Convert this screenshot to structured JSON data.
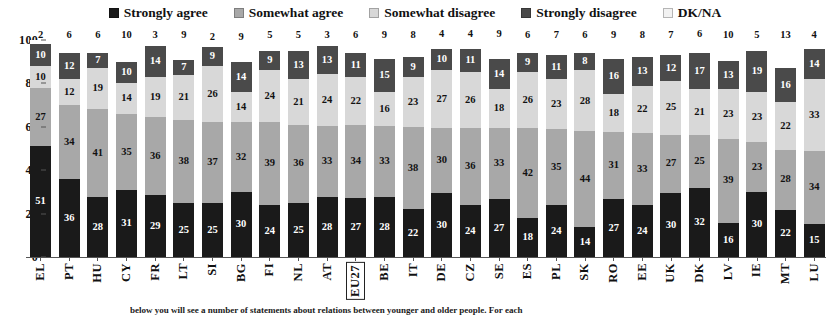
{
  "legend": {
    "position": "top-center",
    "items": [
      {
        "label": "Strongly agree",
        "key": "strongly_agree",
        "color": "#1a1a1a"
      },
      {
        "label": "Somewhat agree",
        "key": "somewhat_agree",
        "color": "#a8a8a8"
      },
      {
        "label": "Somewhat disagree",
        "key": "somewhat_disagree",
        "color": "#d8d8d8"
      },
      {
        "label": "Strongly disagree",
        "key": "strongly_disagree",
        "color": "#4a4a4a"
      },
      {
        "label": "DK/NA",
        "key": "dk_na",
        "color": "#f2f2f2"
      }
    ]
  },
  "caption": {
    "text": "below you will see a number of statements about relations between younger and older people. For each"
  },
  "chart_data": {
    "type": "bar",
    "subtype": "stacked-percentage-column",
    "title": "",
    "subtitle": "",
    "xlabel": "",
    "ylabel": "",
    "ylim": [
      0,
      100
    ],
    "yticks": [
      0,
      20,
      40,
      60,
      80,
      100
    ],
    "grid": false,
    "legend_position": "top-center",
    "highlighted_category": "EU27",
    "categories": [
      "EL",
      "PT",
      "HU",
      "CY",
      "FR",
      "LT",
      "SI",
      "BG",
      "FI",
      "NL",
      "AT",
      "EU27",
      "BE",
      "IT",
      "DE",
      "CZ",
      "SE",
      "ES",
      "PL",
      "SK",
      "RO",
      "EE",
      "UK",
      "DK",
      "LV",
      "IE",
      "MT",
      "LU"
    ],
    "series": [
      {
        "name": "Strongly agree",
        "color": "#1a1a1a",
        "values": [
          51,
          36,
          28,
          31,
          29,
          25,
          25,
          30,
          24,
          25,
          28,
          27,
          28,
          22,
          30,
          24,
          27,
          18,
          24,
          14,
          27,
          24,
          30,
          32,
          16,
          30,
          22,
          15
        ]
      },
      {
        "name": "Somewhat agree",
        "color": "#a8a8a8",
        "values": [
          27,
          34,
          41,
          35,
          36,
          38,
          37,
          32,
          39,
          36,
          33,
          34,
          33,
          38,
          30,
          36,
          33,
          42,
          35,
          44,
          31,
          33,
          27,
          25,
          39,
          23,
          28,
          34
        ]
      },
      {
        "name": "Somewhat disagree",
        "color": "#d8d8d8",
        "values": [
          10,
          12,
          19,
          14,
          19,
          21,
          26,
          14,
          24,
          21,
          24,
          22,
          16,
          23,
          27,
          26,
          18,
          26,
          23,
          28,
          18,
          22,
          25,
          21,
          23,
          23,
          22,
          33
        ]
      },
      {
        "name": "Strongly disagree",
        "color": "#4a4a4a",
        "values": [
          10,
          12,
          7,
          10,
          14,
          7,
          9,
          14,
          9,
          13,
          13,
          11,
          15,
          9,
          10,
          11,
          14,
          9,
          11,
          8,
          16,
          13,
          12,
          17,
          13,
          19,
          16,
          14
        ]
      },
      {
        "name": "DK/NA",
        "color": "#f2f2f2",
        "values": [
          2,
          6,
          6,
          10,
          3,
          9,
          2,
          9,
          5,
          5,
          3,
          6,
          9,
          8,
          4,
          4,
          9,
          6,
          7,
          6,
          9,
          8,
          7,
          6,
          10,
          5,
          13,
          4
        ]
      }
    ]
  }
}
